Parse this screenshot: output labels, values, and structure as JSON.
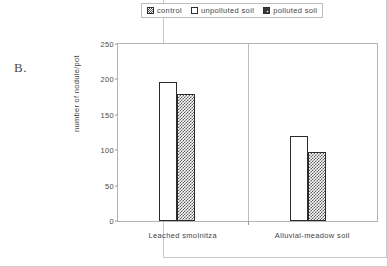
{
  "panel": {
    "label": "B."
  },
  "legend": {
    "position": "top-center",
    "entries": [
      {
        "label": "control",
        "swatch": "checker-small-icon"
      },
      {
        "label": "unpolluted soil",
        "swatch": "white-square-icon"
      },
      {
        "label": "polluted soil",
        "swatch": "crosshatch-square-icon"
      }
    ]
  },
  "chart_data": {
    "type": "bar",
    "title": "",
    "xlabel": "",
    "ylabel": "number of nodule/pot",
    "categories": [
      "Leached smolnitza",
      "Alluvial-meadow soil"
    ],
    "ylim": [
      0,
      250
    ],
    "yticks": [
      0,
      50,
      100,
      150,
      200,
      250
    ],
    "ytick_labels": [
      "0",
      "50",
      "100",
      "150",
      "200",
      "250"
    ],
    "grid": false,
    "legend_position": "top-center",
    "series": [
      {
        "name": "unpolluted soil",
        "fill": "white",
        "values": [
          197,
          120
        ]
      },
      {
        "name": "polluted soil",
        "fill": "crosshatch",
        "values": [
          180,
          98
        ]
      }
    ]
  },
  "colors": {
    "bar_outline": "#2b2b2b",
    "axis": "#b4b4b4",
    "text": "#3f3f3f",
    "background": "#ffffff"
  }
}
